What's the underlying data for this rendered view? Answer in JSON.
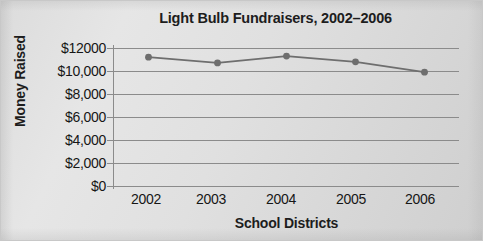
{
  "chart_data": {
    "type": "line",
    "title": "Light Bulb Fundraisers, 2002–2006",
    "xlabel": "School Districts",
    "ylabel": "Money Raised",
    "categories": [
      "2002",
      "2003",
      "2004",
      "2005",
      "2006"
    ],
    "values": [
      11200,
      10700,
      11300,
      10800,
      9900
    ],
    "series": [
      {
        "name": "Money Raised",
        "values": [
          11200,
          10700,
          11300,
          10800,
          9900
        ]
      }
    ],
    "ylim": [
      0,
      12000
    ],
    "ytick_values": [
      12000,
      10000,
      8000,
      6000,
      4000,
      2000,
      0
    ],
    "ytick_labels": [
      "$12000",
      "$10,000",
      "$8,000",
      "$6,000",
      "$4,000",
      "$2,000",
      "$0"
    ],
    "xtick_labels": [
      "2002",
      "2003",
      "2004",
      "2005",
      "2006"
    ],
    "grid": true,
    "legend": false,
    "legend_position": "none",
    "annotations": [],
    "colors": {
      "background": "#dedede",
      "line": "#6e6e6e",
      "marker": "#6e6e6e",
      "grid": "#8b8b8b",
      "axis": "#8b8b8b",
      "text": "#161616",
      "title": "#1d1d1d"
    }
  }
}
